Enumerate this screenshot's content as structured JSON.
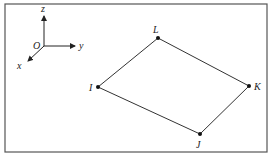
{
  "diagram": {
    "frame": {
      "x": 5,
      "y": 4,
      "width": 262,
      "height": 148,
      "color": "#555555"
    },
    "axes": {
      "origin": {
        "label": "O",
        "x": 44,
        "y": 46
      },
      "z": {
        "label": "z",
        "to": {
          "x": 44,
          "y": 16
        }
      },
      "y": {
        "label": "y",
        "to": {
          "x": 75,
          "y": 46
        }
      },
      "x": {
        "label": "x",
        "to": {
          "x": 28,
          "y": 61
        }
      }
    },
    "nodes": [
      {
        "id": "L",
        "label": "L",
        "x": 158,
        "y": 38
      },
      {
        "id": "K",
        "label": "K",
        "x": 249,
        "y": 86
      },
      {
        "id": "J",
        "label": "J",
        "x": 200,
        "y": 134
      },
      {
        "id": "I",
        "label": "I",
        "x": 98,
        "y": 87
      }
    ],
    "edges": [
      [
        "L",
        "K"
      ],
      [
        "K",
        "J"
      ],
      [
        "J",
        "I"
      ],
      [
        "I",
        "L"
      ]
    ],
    "line_color": "#333333"
  }
}
